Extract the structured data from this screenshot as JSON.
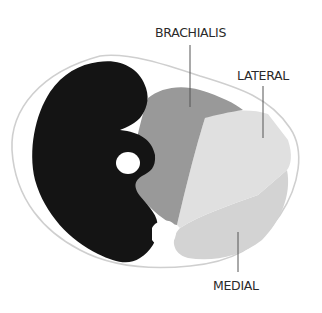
{
  "diagram": {
    "type": "anatomical-cross-section",
    "labels": {
      "brachialis": "BRACHIALIS",
      "lateral": "LATERAL",
      "medial": "MEDIAL"
    },
    "colors": {
      "outline": "#d8d8d8",
      "dark_region": "#141414",
      "brachialis": "#9a9a9a",
      "lateral": "#dedede",
      "medial": "#d2d2d2",
      "bone": "#ffffff",
      "leader_line": "#555555",
      "background": "#ffffff"
    }
  }
}
